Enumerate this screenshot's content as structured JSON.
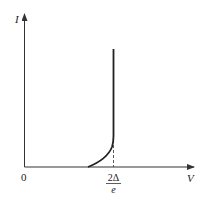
{
  "diagram": {
    "type": "current-voltage characteristic",
    "y_axis": {
      "label": "I"
    },
    "x_axis": {
      "label": "V",
      "origin_label": "0"
    },
    "threshold_label": {
      "numerator": "2Δ",
      "denominator": "e"
    },
    "curve": {
      "description": "Zero current until near threshold, curves upward, then rises vertically at V = 2Δ/e",
      "points": [
        [
          88,
          167
        ],
        [
          95,
          163
        ],
        [
          102,
          158
        ],
        [
          108,
          152
        ],
        [
          112,
          145
        ],
        [
          113.5,
          139
        ],
        [
          113.5,
          49
        ]
      ]
    },
    "dashed_marker": {
      "x": 113.5,
      "y_from": 139,
      "y_to": 167
    },
    "colors": {
      "axis": "#333333",
      "curve": "#222222",
      "background": "#ffffff"
    }
  }
}
